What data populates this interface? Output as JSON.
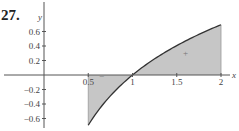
{
  "problem": {
    "number": "27."
  },
  "colors": {
    "fill": "#c6c6c6",
    "curve": "#333333",
    "axis": "#555555"
  },
  "chart_data": {
    "type": "area",
    "title": "",
    "function": "y = ln(x)",
    "xlabel": "x",
    "ylabel": "y",
    "x_ticks": [
      0.5,
      1,
      1.5,
      2
    ],
    "x_tick_labels": [
      "0.5",
      "1",
      "1.5",
      "2"
    ],
    "y_ticks": [
      0.6,
      0.4,
      0.2,
      -0.2,
      -0.4,
      -0.6
    ],
    "y_tick_labels": [
      "0.6",
      "0.4",
      "0.2",
      "−0.2",
      "−0.4",
      "−0.6"
    ],
    "xlim": [
      0,
      2.1
    ],
    "ylim": [
      -0.7,
      0.8
    ],
    "shaded_interval": [
      0.5,
      2
    ],
    "x": [
      0.5,
      0.75,
      1.0,
      1.25,
      1.5,
      1.75,
      2.0
    ],
    "y": [
      -0.693,
      -0.288,
      0.0,
      0.223,
      0.405,
      0.56,
      0.693
    ],
    "annotations": [
      {
        "text": "−",
        "x": 0.65,
        "y": -0.05,
        "meaning": "negative region"
      },
      {
        "text": "+",
        "x": 1.6,
        "y": 0.26,
        "meaning": "positive region"
      }
    ],
    "grid": false,
    "legend": null
  }
}
